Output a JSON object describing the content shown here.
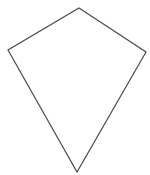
{
  "figure": {
    "shape_name": "kite",
    "background_color": "#ffffff",
    "stroke_color": "#4a4a4a",
    "fill_color": "none",
    "stroke_width": 1.2,
    "canvas": {
      "width": 150,
      "height": 175
    }
  },
  "chart_data": {
    "type": "scatter",
    "xlabel": "",
    "ylabel": "",
    "grid": false,
    "legend": null,
    "xlim": [
      0,
      150
    ],
    "ylim": [
      0,
      175
    ],
    "vertices": [
      {
        "name": "top",
        "x": 79,
        "y": 8
      },
      {
        "name": "right",
        "x": 146,
        "y": 52
      },
      {
        "name": "bottom",
        "x": 77,
        "y": 172
      },
      {
        "name": "left",
        "x": 8,
        "y": 50
      }
    ],
    "edges": [
      {
        "from": "top",
        "to": "right"
      },
      {
        "from": "right",
        "to": "bottom"
      },
      {
        "from": "bottom",
        "to": "left"
      },
      {
        "from": "left",
        "to": "top"
      }
    ],
    "polygon_points": "79,8 146,52 77,172 8,50",
    "closed": true
  }
}
